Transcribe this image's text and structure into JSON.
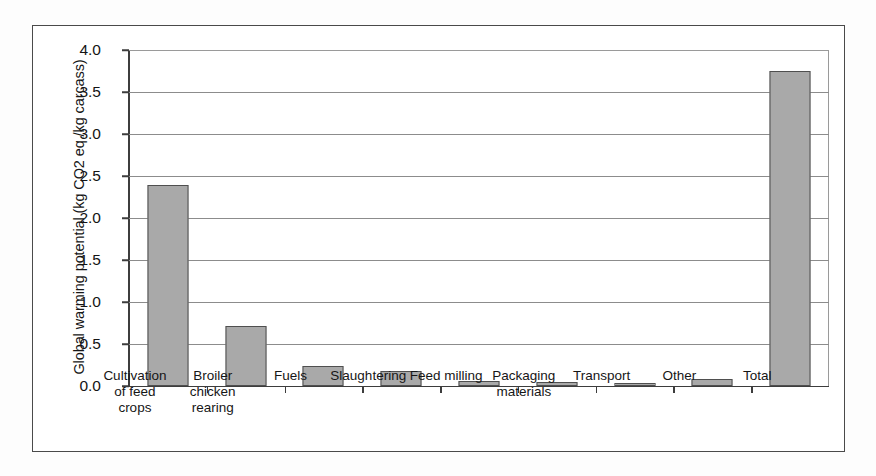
{
  "chart_data": {
    "type": "bar",
    "title": "",
    "xlabel": "",
    "ylabel": "Global warming potential (kg CO2 eq./kg carcass)",
    "ylim": [
      0.0,
      4.0
    ],
    "ytick_labels": [
      "4.0",
      "3.5",
      "3.0",
      "2.5",
      "2.0",
      "1.5",
      "1.0",
      "0.5",
      "0.0"
    ],
    "ytick_values": [
      4.0,
      3.5,
      3.0,
      2.5,
      2.0,
      1.5,
      1.0,
      0.5,
      0.0
    ],
    "grid": true,
    "legend": false,
    "bar_color": "#a9a9a9",
    "bar_edge_color": "#4f4f4f",
    "categories": [
      "Cultivation of feed crops",
      "Broiler chicken rearing",
      "Fuels",
      "Slaughtering",
      "Feed milling",
      "Packaging materials",
      "Transport",
      "Other",
      "Total"
    ],
    "values": [
      2.39,
      0.72,
      0.24,
      0.18,
      0.06,
      0.05,
      0.04,
      0.08,
      3.75
    ]
  }
}
